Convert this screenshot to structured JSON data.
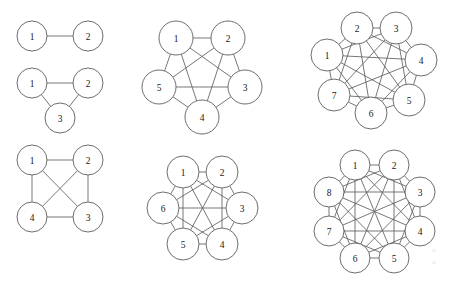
{
  "figure": {
    "background_color": "#ffffff",
    "stroke_color": "#5e5e5e",
    "label_color": "#202020",
    "node_fill": "#ffffff",
    "width": 449,
    "height": 284
  },
  "graphs": [
    {
      "id": "k2",
      "name": "complete-graph-k2",
      "order": 2,
      "layout": "linear",
      "node_radius": 15,
      "nodes": [
        {
          "label": "1",
          "x": 32,
          "y": 36
        },
        {
          "label": "2",
          "x": 88,
          "y": 36
        }
      ],
      "edges": [
        [
          0,
          1
        ]
      ]
    },
    {
      "id": "k3",
      "name": "complete-graph-k3",
      "order": 3,
      "layout": "triangle",
      "node_radius": 15,
      "nodes": [
        {
          "label": "1",
          "x": 32,
          "y": 83
        },
        {
          "label": "2",
          "x": 88,
          "y": 83
        },
        {
          "label": "3",
          "x": 60,
          "y": 118
        }
      ],
      "edges": [
        [
          0,
          1
        ],
        [
          1,
          2
        ],
        [
          2,
          0
        ]
      ]
    },
    {
      "id": "k4",
      "name": "complete-graph-k4",
      "order": 4,
      "layout": "square",
      "node_radius": 15,
      "nodes": [
        {
          "label": "1",
          "x": 32,
          "y": 160
        },
        {
          "label": "2",
          "x": 88,
          "y": 160
        },
        {
          "label": "3",
          "x": 88,
          "y": 217
        },
        {
          "label": "4",
          "x": 32,
          "y": 217
        }
      ],
      "edges": [
        [
          0,
          1
        ],
        [
          0,
          2
        ],
        [
          0,
          3
        ],
        [
          1,
          2
        ],
        [
          1,
          3
        ],
        [
          2,
          3
        ]
      ]
    },
    {
      "id": "k5",
      "name": "complete-graph-k5",
      "order": 5,
      "layout": "pentagon",
      "node_radius": 17,
      "nodes": [
        {
          "label": "1",
          "x": 176,
          "y": 38
        },
        {
          "label": "2",
          "x": 228,
          "y": 38
        },
        {
          "label": "3",
          "x": 245,
          "y": 87
        },
        {
          "label": "4",
          "x": 202,
          "y": 117
        },
        {
          "label": "5",
          "x": 159,
          "y": 87
        }
      ],
      "edges": [
        [
          0,
          1
        ],
        [
          0,
          2
        ],
        [
          0,
          3
        ],
        [
          0,
          4
        ],
        [
          1,
          2
        ],
        [
          1,
          3
        ],
        [
          1,
          4
        ],
        [
          2,
          3
        ],
        [
          2,
          4
        ],
        [
          3,
          4
        ]
      ]
    },
    {
      "id": "k6",
      "name": "complete-graph-k6",
      "order": 6,
      "layout": "hexagon",
      "node_radius": 16,
      "nodes": [
        {
          "label": "1",
          "x": 183,
          "y": 172
        },
        {
          "label": "2",
          "x": 222,
          "y": 172
        },
        {
          "label": "3",
          "x": 242,
          "y": 208
        },
        {
          "label": "4",
          "x": 222,
          "y": 244
        },
        {
          "label": "5",
          "x": 183,
          "y": 244
        },
        {
          "label": "6",
          "x": 163,
          "y": 208
        }
      ],
      "edges": [
        [
          0,
          1
        ],
        [
          0,
          2
        ],
        [
          0,
          3
        ],
        [
          0,
          4
        ],
        [
          0,
          5
        ],
        [
          1,
          2
        ],
        [
          1,
          3
        ],
        [
          1,
          4
        ],
        [
          1,
          5
        ],
        [
          2,
          3
        ],
        [
          2,
          4
        ],
        [
          2,
          5
        ],
        [
          3,
          4
        ],
        [
          3,
          5
        ],
        [
          4,
          5
        ]
      ]
    },
    {
      "id": "k7",
      "name": "complete-graph-k7",
      "order": 7,
      "layout": "heptagon",
      "node_radius": 16,
      "nodes": [
        {
          "label": "1",
          "x": 327,
          "y": 55
        },
        {
          "label": "2",
          "x": 357,
          "y": 28
        },
        {
          "label": "3",
          "x": 396,
          "y": 28
        },
        {
          "label": "4",
          "x": 421,
          "y": 60
        },
        {
          "label": "5",
          "x": 409,
          "y": 100
        },
        {
          "label": "6",
          "x": 371,
          "y": 113
        },
        {
          "label": "7",
          "x": 334,
          "y": 95
        }
      ],
      "edges": [
        [
          0,
          1
        ],
        [
          0,
          2
        ],
        [
          0,
          3
        ],
        [
          0,
          4
        ],
        [
          0,
          5
        ],
        [
          0,
          6
        ],
        [
          1,
          2
        ],
        [
          1,
          3
        ],
        [
          1,
          4
        ],
        [
          1,
          5
        ],
        [
          1,
          6
        ],
        [
          2,
          3
        ],
        [
          2,
          4
        ],
        [
          2,
          5
        ],
        [
          2,
          6
        ],
        [
          3,
          4
        ],
        [
          3,
          5
        ],
        [
          3,
          6
        ],
        [
          4,
          5
        ],
        [
          4,
          6
        ],
        [
          5,
          6
        ]
      ]
    },
    {
      "id": "k8",
      "name": "complete-graph-k8",
      "order": 8,
      "layout": "octagon",
      "node_radius": 15,
      "nodes": [
        {
          "label": "1",
          "x": 355,
          "y": 165
        },
        {
          "label": "2",
          "x": 394,
          "y": 165
        },
        {
          "label": "3",
          "x": 420,
          "y": 192
        },
        {
          "label": "4",
          "x": 420,
          "y": 231
        },
        {
          "label": "5",
          "x": 394,
          "y": 258
        },
        {
          "label": "6",
          "x": 355,
          "y": 258
        },
        {
          "label": "7",
          "x": 329,
          "y": 231
        },
        {
          "label": "8",
          "x": 329,
          "y": 192
        }
      ],
      "edges": [
        [
          0,
          1
        ],
        [
          0,
          2
        ],
        [
          0,
          3
        ],
        [
          0,
          4
        ],
        [
          0,
          5
        ],
        [
          0,
          6
        ],
        [
          0,
          7
        ],
        [
          1,
          2
        ],
        [
          1,
          3
        ],
        [
          1,
          4
        ],
        [
          1,
          5
        ],
        [
          1,
          6
        ],
        [
          1,
          7
        ],
        [
          2,
          3
        ],
        [
          2,
          4
        ],
        [
          2,
          5
        ],
        [
          2,
          6
        ],
        [
          2,
          7
        ],
        [
          3,
          4
        ],
        [
          3,
          5
        ],
        [
          3,
          6
        ],
        [
          3,
          7
        ],
        [
          4,
          5
        ],
        [
          4,
          6
        ],
        [
          4,
          7
        ],
        [
          5,
          6
        ],
        [
          5,
          7
        ],
        [
          6,
          7
        ]
      ]
    }
  ],
  "artifacts": [
    {
      "text": "≈",
      "x": 432,
      "y": 246
    },
    {
      "text": "≈",
      "x": 432,
      "y": 258
    }
  ]
}
